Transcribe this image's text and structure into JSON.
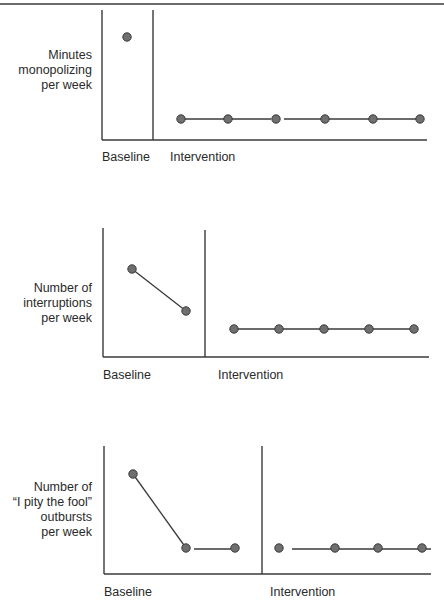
{
  "page": {
    "header_fragment": "g... ... p...",
    "rule_color": "#6b6b6b"
  },
  "style": {
    "axis_color": "#3a3a3a",
    "line_color": "#3a3a3a",
    "marker_fill": "#6f6f6f",
    "marker_stroke": "#3a3a3a"
  },
  "chart_data": [
    {
      "type": "line",
      "title": "",
      "ylabel": "Minutes monopolizing per week",
      "ylabel_lines": [
        "Minutes",
        "monopolizing",
        "per week"
      ],
      "xlabel": "",
      "phases": [
        {
          "label": "Baseline",
          "sessions": [
            1
          ],
          "values": [
            8.1
          ]
        },
        {
          "label": "Intervention",
          "sessions": [
            1,
            2,
            3,
            4,
            5,
            6
          ],
          "values": [
            1.6,
            1.6,
            1.6,
            1.6,
            1.6,
            1.6
          ]
        }
      ],
      "ylim": [
        0,
        10
      ],
      "ticks": "none",
      "grid": false,
      "legend": "none",
      "notes": "Single-subject A-B design; no numeric axis ticks shown; values are relative estimates on a 0–10 scale."
    },
    {
      "type": "line",
      "title": "",
      "ylabel": "Number of interruptions per week",
      "ylabel_lines": [
        "Number of",
        "interruptions",
        "per week"
      ],
      "xlabel": "",
      "phases": [
        {
          "label": "Baseline",
          "sessions": [
            1,
            2
          ],
          "values": [
            6.8,
            3.6
          ]
        },
        {
          "label": "Intervention",
          "sessions": [
            1,
            2,
            3,
            4,
            5
          ],
          "values": [
            2.2,
            2.2,
            2.2,
            2.2,
            2.2
          ]
        }
      ],
      "ylim": [
        0,
        10
      ],
      "ticks": "none",
      "grid": false,
      "legend": "none"
    },
    {
      "type": "line",
      "title": "",
      "ylabel": "Number of “I pity the fool” outbursts per week",
      "ylabel_lines": [
        "Number of",
        "“I pity the fool”",
        "outbursts",
        "per week"
      ],
      "xlabel": "",
      "phases": [
        {
          "label": "Baseline",
          "sessions": [
            1,
            2,
            3
          ],
          "values": [
            7.8,
            2.0,
            2.0
          ]
        },
        {
          "label": "Intervention",
          "sessions": [
            1,
            2,
            3,
            4
          ],
          "values": [
            2.0,
            2.0,
            2.0,
            2.0
          ]
        }
      ],
      "ylim": [
        0,
        10
      ],
      "ticks": "none",
      "grid": false,
      "legend": "none"
    }
  ],
  "layout": [
    {
      "axis": {
        "x0": 102,
        "y_top": 10,
        "y_bottom": 140,
        "x_end": 427
      },
      "phase_line_x": 153,
      "phase_line_top": 10,
      "ylabel_top": 48,
      "xlabel_y": 150,
      "xlabel_x": [
        102,
        170
      ],
      "points": [
        [
          [
            127,
            37
          ]
        ],
        [
          [
            181,
            119
          ],
          [
            228,
            119
          ],
          [
            276,
            119
          ],
          [
            325,
            119
          ],
          [
            373,
            119
          ],
          [
            420,
            119
          ]
        ]
      ],
      "segments": [
        [
          [
            181,
            119
          ],
          [
            224,
            119
          ]
        ],
        [
          [
            232,
            119
          ],
          [
            271,
            119
          ]
        ],
        [
          [
            284,
            119
          ],
          [
            420,
            119
          ]
        ]
      ]
    },
    {
      "axis": {
        "x0": 103,
        "y_top": 228,
        "y_bottom": 357,
        "x_end": 429
      },
      "phase_line_x": 205,
      "phase_line_top": 230,
      "ylabel_top": 281,
      "xlabel_y": 368,
      "xlabel_x": [
        103,
        218
      ],
      "points": [
        [
          [
            132,
            269
          ],
          [
            186,
            311
          ]
        ],
        [
          [
            234,
            329
          ],
          [
            279,
            329
          ],
          [
            324,
            329
          ],
          [
            369,
            329
          ],
          [
            414,
            329
          ]
        ]
      ],
      "segments": [
        [
          [
            132,
            269
          ],
          [
            186,
            311
          ]
        ],
        [
          [
            234,
            329
          ],
          [
            414,
            329
          ]
        ]
      ]
    },
    {
      "axis": {
        "x0": 104,
        "y_top": 446,
        "y_bottom": 574,
        "x_end": 431
      },
      "phase_line_x": 262,
      "phase_line_top": 446,
      "ylabel_top": 480,
      "xlabel_y": 585,
      "xlabel_x": [
        104,
        270
      ],
      "points": [
        [
          [
            133,
            474
          ],
          [
            186,
            548
          ],
          [
            235,
            548
          ]
        ],
        [
          [
            279,
            548
          ],
          [
            335,
            548
          ],
          [
            378,
            548
          ],
          [
            422,
            548
          ]
        ]
      ],
      "segments": [
        [
          [
            133,
            474
          ],
          [
            186,
            548
          ]
        ],
        [
          [
            194,
            549
          ],
          [
            231,
            549
          ]
        ],
        [
          [
            292,
            549
          ],
          [
            431,
            549
          ]
        ]
      ]
    }
  ]
}
